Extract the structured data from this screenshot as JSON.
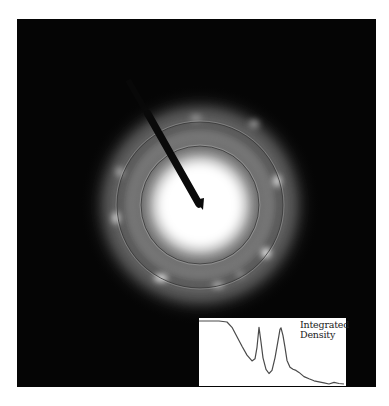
{
  "figure": {
    "type": "selected-area electron diffraction pattern",
    "background_color": "#050505",
    "pattern_center": [
      200,
      205
    ],
    "rings": [
      {
        "name": "inner-ring",
        "radius": 59
      },
      {
        "name": "outer-ring",
        "radius": 83
      }
    ],
    "beam_stop": {
      "from": [
        128,
        80
      ],
      "to": [
        202,
        210
      ]
    }
  },
  "inset": {
    "label_line1": "Integrated",
    "label_line2": "Density"
  },
  "chart_data": {
    "type": "line",
    "title": "Integrated Density",
    "xlabel": "",
    "ylabel": "",
    "grid": false,
    "series": [
      {
        "name": "Integrated Density",
        "x": [
          0,
          10,
          20,
          28,
          33,
          38,
          43,
          48,
          53,
          56,
          58,
          60,
          62,
          64,
          67,
          70,
          73,
          76,
          79,
          81,
          82,
          84,
          86,
          88,
          91,
          94,
          97,
          100,
          105,
          110,
          115,
          120,
          125,
          130,
          135,
          140,
          145
        ],
        "values": [
          100,
          100,
          100,
          98,
          88,
          70,
          52,
          35,
          24,
          28,
          50,
          88,
          60,
          30,
          8,
          0,
          6,
          30,
          62,
          84,
          87,
          72,
          50,
          25,
          12,
          8,
          6,
          2,
          -6,
          -10,
          -14,
          -16,
          -18,
          -20,
          -17,
          -19,
          -20
        ]
      }
    ]
  }
}
